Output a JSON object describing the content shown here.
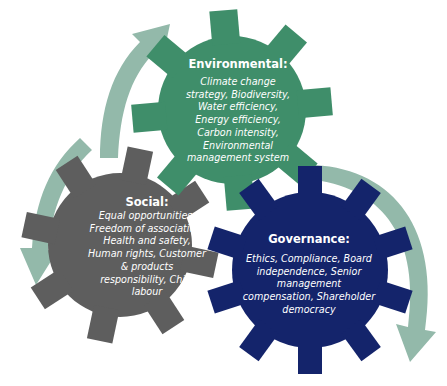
{
  "colors": {
    "environmental": "#3f8e6a",
    "social": "#5e5e5e",
    "governance": "#14246b",
    "arrows": "#93b9aa",
    "text": "#ffffff",
    "background": "#ffffff"
  },
  "gears": {
    "environmental": {
      "title": "Environmental:",
      "items": "Climate change strategy, Biodiversity, Water efficiency, Energy efficiency, Carbon intensity, Environmental management system",
      "lines": [
        "Climate change",
        "strategy, Biodiversity,",
        "Water efficiency,",
        "Energy efficiency,",
        "Carbon intensity,",
        "Environmental",
        "management system"
      ]
    },
    "social": {
      "title": "Social:",
      "items": "Equal opportunities, Freedom of association, Health and safety, Human rights, Customer & products responsibility, Child labour",
      "lines": [
        "Equal opportunities,",
        "Freedom of association,",
        "Health and safety,",
        "Human rights, Customer",
        "& products",
        "responsibility, Child",
        "labour"
      ]
    },
    "governance": {
      "title": "Governance:",
      "items": "Ethics, Compliance, Board independence, Senior management compensation, Shareholder democracy",
      "lines": [
        "Ethics, Compliance, Board",
        "independence, Senior",
        "management",
        "compensation, Shareholder",
        "democracy"
      ]
    }
  },
  "arrows": [
    {
      "name": "arrow-social-to-environmental",
      "direction": "up-right"
    },
    {
      "name": "arrow-environmental-to-governance",
      "direction": "down"
    },
    {
      "name": "arrow-top-left-to-social",
      "direction": "down-left"
    }
  ]
}
